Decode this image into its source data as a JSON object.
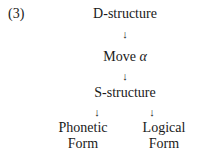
{
  "example_number": "(3)",
  "diagram": {
    "nodes": {
      "d_structure": "D-structure",
      "move": "Move",
      "move_symbol": "α",
      "s_structure": "S-structure",
      "phonetic_line1": "Phonetic",
      "phonetic_line2": "Form",
      "logical_line1": "Logical",
      "logical_line2": "Form"
    },
    "arrow_glyph": "↓",
    "edges": [
      [
        "D-structure",
        "Move α"
      ],
      [
        "Move α",
        "S-structure"
      ],
      [
        "S-structure",
        "Phonetic Form"
      ],
      [
        "S-structure",
        "Logical Form"
      ]
    ]
  }
}
